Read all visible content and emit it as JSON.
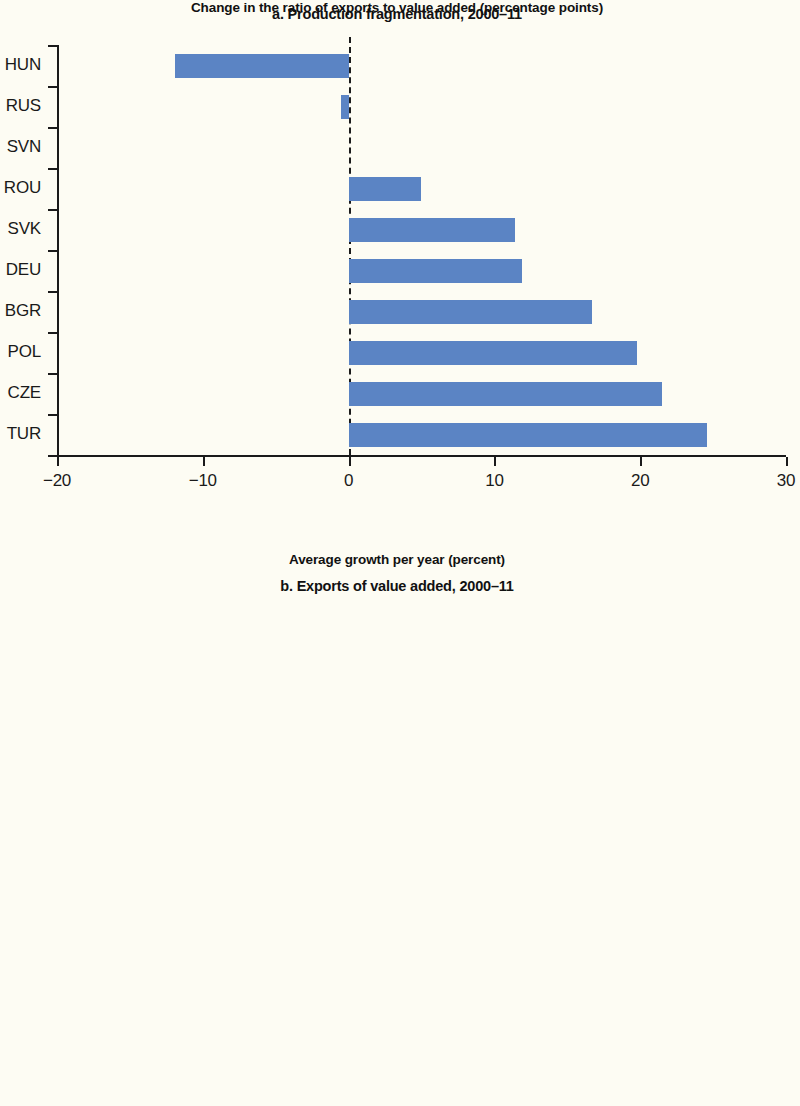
{
  "figure": {
    "background_color": "#fdfcf3",
    "bar_color": "#5b84c4",
    "axis_color": "#1a1a1a"
  },
  "panel_a": {
    "title": "a. Production fragmentation, 2000–11",
    "axis_title": "Change in the ratio of exports to value added (percentage points)",
    "tick_labels": [
      "−20",
      "−10",
      "0",
      "10",
      "20",
      "30"
    ],
    "categories": [
      "HUN",
      "RUS",
      "SVN",
      "ROU",
      "SVK",
      "DEU",
      "BGR",
      "POL",
      "CZE",
      "TUR"
    ]
  },
  "panel_b": {
    "title": "b. Exports of value added, 2000–11",
    "axis_title": "Average growth per year (percent)",
    "tick_labels": [
      "0",
      "5",
      "10",
      "15",
      "20"
    ],
    "categories": [
      "SVN",
      "HUN",
      "DEU",
      "RUS",
      "CZE",
      "SVK",
      "BGR",
      "ROU",
      "POL",
      "TUR"
    ]
  },
  "chart_data": [
    {
      "type": "bar",
      "orientation": "horizontal",
      "title": "a. Production fragmentation, 2000–11",
      "xlabel": "Change in the ratio of exports to value added (percentage points)",
      "ylabel": "",
      "xlim": [
        -20,
        30
      ],
      "xticks": [
        -20,
        -10,
        0,
        10,
        20,
        30
      ],
      "grid": false,
      "legend": "none",
      "zero_reference_line": 0,
      "categories": [
        "HUN",
        "RUS",
        "SVN",
        "ROU",
        "SVK",
        "DEU",
        "BGR",
        "POL",
        "CZE",
        "TUR"
      ],
      "values": [
        -11.9,
        -0.5,
        0,
        5.0,
        11.4,
        11.9,
        16.7,
        19.8,
        21.5,
        24.6
      ]
    },
    {
      "type": "bar",
      "orientation": "horizontal",
      "title": "b. Exports of value added, 2000–11",
      "xlabel": "Average growth per year (percent)",
      "ylabel": "",
      "xlim": [
        0,
        20
      ],
      "xticks": [
        0,
        5,
        10,
        15,
        20
      ],
      "grid": false,
      "legend": "none",
      "categories": [
        "SVN",
        "HUN",
        "DEU",
        "RUS",
        "CZE",
        "SVK",
        "BGR",
        "ROU",
        "POL",
        "TUR"
      ],
      "values": [
        9.2,
        10.4,
        11.5,
        12.9,
        15.9,
        16.4,
        17.8,
        18.3,
        18.7,
        19.2
      ]
    }
  ]
}
